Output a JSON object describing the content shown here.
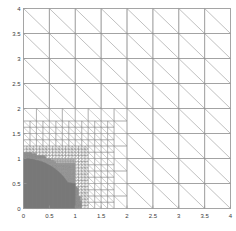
{
  "figure": {
    "title": "",
    "background_color": "#ffffff"
  },
  "axes": {
    "x_label": "",
    "y_label": "",
    "x_ticks": [
      "0",
      "0.5",
      "1",
      "1.5",
      "2",
      "2.5",
      "3",
      "3.5",
      "4"
    ],
    "y_ticks": [
      "0",
      "0.5",
      "1",
      "1.5",
      "2",
      "2.5",
      "3",
      "3.5",
      "4"
    ],
    "axis_color": "#9a9a9a",
    "tick_label_color": "#3a3a3a"
  },
  "chart_data": {
    "type": "line",
    "title": "",
    "xlabel": "",
    "ylabel": "",
    "xlim": [
      0,
      4
    ],
    "ylim": [
      0,
      4
    ],
    "xticks": [
      0,
      0.5,
      1,
      1.5,
      2,
      2.5,
      3,
      3.5,
      4
    ],
    "yticks": [
      0,
      0.5,
      1,
      1.5,
      2,
      2.5,
      3,
      3.5,
      4
    ],
    "xtick_labels": [
      "0",
      "0.5",
      "1",
      "1.5",
      "2",
      "2.5",
      "3",
      "3.5",
      "4"
    ],
    "ytick_labels": [
      "0",
      "0.5",
      "1",
      "1.5",
      "2",
      "2.5",
      "3",
      "3.5",
      "4"
    ],
    "grid": false,
    "legend": null,
    "mesh": {
      "domain": [
        0,
        4,
        0,
        4
      ],
      "element_type": "triangle",
      "diagonal_direction": "top-left-to-bottom-right",
      "coarse_cell_size": 0.5,
      "line_color": "#8c8c8c",
      "fill_color": "#6f6f6f",
      "refinement_levels": [
        {
          "level": 0,
          "cell_size": 0.5,
          "region": [
            0,
            4,
            0,
            4
          ]
        },
        {
          "level": 1,
          "cell_size": 0.25,
          "region": [
            0,
            1.75,
            0,
            1.75
          ]
        },
        {
          "level": 2,
          "cell_size": 0.125,
          "region": [
            0,
            1.25,
            0,
            1.25
          ]
        },
        {
          "level": 3,
          "cell_size": 0.0625,
          "region": [
            0,
            1.0,
            0,
            1.0
          ]
        },
        {
          "level": 4,
          "cell_size": 0.03125,
          "region": [
            0,
            1.0,
            0,
            0.875
          ]
        }
      ],
      "dense_region": {
        "shape": "quarter-disc-plus-block",
        "center": [
          0,
          0
        ],
        "radius": 1.0,
        "block": [
          0,
          1.0,
          0,
          0.5
        ],
        "appearance": "solid-grey"
      }
    }
  }
}
